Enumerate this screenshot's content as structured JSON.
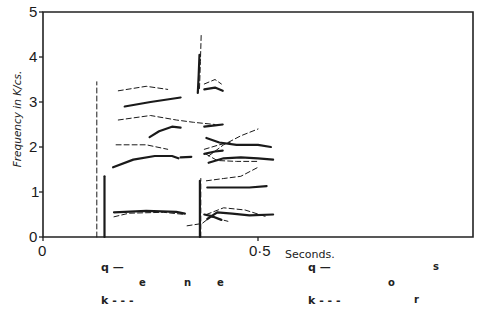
{
  "chart_data": {
    "type": "line",
    "title": "",
    "xlabel": "Seconds.",
    "ylabel": "Frequency in K/cs.",
    "xlim": [
      0,
      1.0
    ],
    "ylim": [
      0,
      5
    ],
    "x_ticks": [
      {
        "value": 0,
        "label": "0"
      },
      {
        "value": 0.5,
        "label": "0·5"
      }
    ],
    "y_ticks": [
      {
        "value": 0,
        "label": "0"
      },
      {
        "value": 1,
        "label": "1"
      },
      {
        "value": 2,
        "label": "2"
      },
      {
        "value": 3,
        "label": "3"
      },
      {
        "value": 4,
        "label": "4"
      },
      {
        "value": 5,
        "label": "5"
      }
    ],
    "grid": false,
    "legend": [
      {
        "symbol": "q",
        "style": "solid",
        "label": "q —"
      },
      {
        "symbol": "k",
        "style": "dashed",
        "label": "k - - -"
      }
    ],
    "series": [
      {
        "name": "q",
        "style": "solid",
        "segments": [
          [
            [
              0.143,
              0.0
            ],
            [
              0.143,
              1.35
            ]
          ],
          [
            [
              0.165,
              0.55
            ],
            [
              0.24,
              0.58
            ],
            [
              0.31,
              0.56
            ],
            [
              0.33,
              0.52
            ]
          ],
          [
            [
              0.163,
              1.55
            ],
            [
              0.21,
              1.72
            ],
            [
              0.26,
              1.8
            ],
            [
              0.3,
              1.8
            ],
            [
              0.315,
              1.75
            ]
          ],
          [
            [
              0.32,
              1.77
            ],
            [
              0.345,
              1.78
            ]
          ],
          [
            [
              0.19,
              2.9
            ],
            [
              0.25,
              3.0
            ],
            [
              0.32,
              3.1
            ]
          ],
          [
            [
              0.248,
              2.22
            ],
            [
              0.27,
              2.35
            ],
            [
              0.3,
              2.45
            ],
            [
              0.32,
              2.43
            ]
          ],
          [
            [
              0.375,
              3.28
            ],
            [
              0.4,
              3.32
            ],
            [
              0.418,
              3.25
            ]
          ],
          [
            [
              0.375,
              2.45
            ],
            [
              0.4,
              2.48
            ],
            [
              0.418,
              2.5
            ]
          ],
          [
            [
              0.375,
              1.85
            ],
            [
              0.4,
              1.9
            ],
            [
              0.418,
              1.92
            ]
          ],
          [
            [
              0.375,
              0.5
            ],
            [
              0.39,
              0.47
            ],
            [
              0.415,
              0.38
            ]
          ],
          [
            [
              0.365,
              0.0
            ],
            [
              0.365,
              1.25
            ]
          ],
          [
            [
              0.36,
              3.2
            ],
            [
              0.362,
              3.6
            ],
            [
              0.364,
              4.05
            ]
          ],
          [
            [
              0.38,
              2.2
            ],
            [
              0.41,
              2.1
            ],
            [
              0.45,
              2.05
            ],
            [
              0.5,
              2.05
            ],
            [
              0.53,
              2.0
            ]
          ],
          [
            [
              0.385,
              1.65
            ],
            [
              0.42,
              1.75
            ],
            [
              0.46,
              1.77
            ],
            [
              0.5,
              1.75
            ],
            [
              0.535,
              1.72
            ]
          ],
          [
            [
              0.382,
              1.1
            ],
            [
              0.43,
              1.1
            ],
            [
              0.48,
              1.1
            ],
            [
              0.52,
              1.13
            ]
          ],
          [
            [
              0.382,
              0.4
            ],
            [
              0.405,
              0.55
            ],
            [
              0.44,
              0.52
            ],
            [
              0.48,
              0.48
            ],
            [
              0.535,
              0.5
            ]
          ]
        ]
      },
      {
        "name": "k",
        "style": "dashed",
        "segments": [
          [
            [
              0.125,
              0.0
            ],
            [
              0.125,
              3.45
            ]
          ],
          [
            [
              0.165,
              0.45
            ],
            [
              0.2,
              0.53
            ],
            [
              0.28,
              0.55
            ],
            [
              0.33,
              0.5
            ]
          ],
          [
            [
              0.175,
              3.25
            ],
            [
              0.24,
              3.35
            ],
            [
              0.29,
              3.28
            ]
          ],
          [
            [
              0.175,
              2.6
            ],
            [
              0.25,
              2.7
            ],
            [
              0.31,
              2.6
            ],
            [
              0.35,
              2.55
            ],
            [
              0.4,
              2.5
            ]
          ],
          [
            [
              0.17,
              2.05
            ],
            [
              0.24,
              2.05
            ],
            [
              0.29,
              1.95
            ]
          ],
          [
            [
              0.335,
              0.25
            ],
            [
              0.37,
              0.3
            ],
            [
              0.39,
              0.45
            ],
            [
              0.43,
              0.35
            ]
          ],
          [
            [
              0.375,
              3.4
            ],
            [
              0.4,
              3.5
            ],
            [
              0.415,
              3.4
            ]
          ],
          [
            [
              0.375,
              1.95
            ],
            [
              0.41,
              2.05
            ],
            [
              0.435,
              2.1
            ]
          ],
          [
            [
              0.367,
              0.0
            ],
            [
              0.367,
              1.3
            ]
          ],
          [
            [
              0.364,
              3.3
            ],
            [
              0.366,
              3.9
            ],
            [
              0.368,
              4.5
            ]
          ],
          [
            [
              0.385,
              1.8
            ],
            [
              0.42,
              2.05
            ],
            [
              0.46,
              2.25
            ],
            [
              0.5,
              2.4
            ]
          ],
          [
            [
              0.378,
              1.85
            ],
            [
              0.405,
              1.7
            ],
            [
              0.45,
              1.68
            ],
            [
              0.5,
              1.68
            ]
          ],
          [
            [
              0.38,
              1.25
            ],
            [
              0.42,
              1.3
            ],
            [
              0.46,
              1.35
            ],
            [
              0.5,
              1.55
            ]
          ],
          [
            [
              0.38,
              0.5
            ],
            [
              0.42,
              0.65
            ],
            [
              0.47,
              0.6
            ],
            [
              0.52,
              0.45
            ]
          ]
        ]
      }
    ],
    "annotations": {
      "legend_labels": [
        "q —",
        "k - - -"
      ],
      "phonetic_row_1": [
        {
          "text": "e",
          "x_px": 142,
          "y_px": 283
        },
        {
          "text": "n",
          "x_px": 186,
          "y_px": 283
        },
        {
          "text": "e",
          "x_px": 219,
          "y_px": 283
        },
        {
          "text": "o",
          "x_px": 391,
          "y_px": 283
        },
        {
          "text": "s",
          "x_px": 435,
          "y_px": 267
        },
        {
          "text": "r",
          "x_px": 416,
          "y_px": 300
        }
      ]
    }
  },
  "axis": {
    "ylabel": "Frequency in K/cs.",
    "xlabel": "Seconds.",
    "y_ticks": [
      "0",
      "1",
      "2",
      "3",
      "4",
      "5"
    ],
    "x_ticks": [
      "0",
      "0·5"
    ]
  },
  "legend": {
    "left": {
      "q": "q —",
      "k": "k - - -"
    },
    "right": {
      "q": "q —",
      "k": "k - - -"
    }
  },
  "phonetics": {
    "left": [
      "e",
      "n",
      "e"
    ],
    "right": [
      "o",
      "s",
      "r"
    ]
  }
}
